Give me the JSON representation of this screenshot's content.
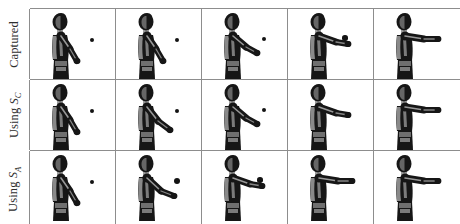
{
  "figure": {
    "type": "motion-capture-frame-grid",
    "rows": 3,
    "columns": 5,
    "background_color": "#ffffff",
    "line_color": "#8d8d8d",
    "figure_color": "#1a1a1a",
    "skin_color": "#9a9a9a",
    "ball_color": "#131313"
  },
  "rows": [
    {
      "id": "row-captured",
      "label": "Captured",
      "label_prefix": "Captured",
      "label_symbol": "",
      "label_subscript": "",
      "frames": [
        {
          "index": 1,
          "arm_stage": "down",
          "ball_x": 62,
          "ball_y": 31,
          "ball_r": 2.4,
          "ball_visible": true
        },
        {
          "index": 2,
          "arm_stage": "down",
          "ball_x": 61,
          "ball_y": 31,
          "ball_r": 2.4,
          "ball_visible": true
        },
        {
          "index": 3,
          "arm_stage": "mid",
          "ball_x": 62,
          "ball_y": 30,
          "ball_r": 2.4,
          "ball_visible": true
        },
        {
          "index": 4,
          "arm_stage": "reach",
          "ball_x": 57,
          "ball_y": 29,
          "ball_r": 2.8,
          "ball_visible": true
        },
        {
          "index": 5,
          "arm_stage": "extended",
          "ball_x": 0,
          "ball_y": 0,
          "ball_r": 0,
          "ball_visible": false
        }
      ]
    },
    {
      "id": "row-using-sc",
      "label": "Using SC",
      "label_prefix": "Using ",
      "label_symbol": "S",
      "label_subscript": "C",
      "frames": [
        {
          "index": 1,
          "arm_stage": "down",
          "ball_x": 62,
          "ball_y": 31,
          "ball_r": 2.4,
          "ball_visible": true
        },
        {
          "index": 2,
          "arm_stage": "lowmid",
          "ball_x": 61,
          "ball_y": 31,
          "ball_r": 2.4,
          "ball_visible": true
        },
        {
          "index": 3,
          "arm_stage": "mid",
          "ball_x": 62,
          "ball_y": 30,
          "ball_r": 2.4,
          "ball_visible": true
        },
        {
          "index": 4,
          "arm_stage": "reach",
          "ball_x": 0,
          "ball_y": 0,
          "ball_r": 0,
          "ball_visible": false
        },
        {
          "index": 5,
          "arm_stage": "extended",
          "ball_x": 0,
          "ball_y": 0,
          "ball_r": 0,
          "ball_visible": false
        }
      ]
    },
    {
      "id": "row-using-sa",
      "label": "Using SA",
      "label_prefix": "Using ",
      "label_symbol": "S",
      "label_subscript": "A",
      "frames": [
        {
          "index": 1,
          "arm_stage": "down",
          "ball_x": 62,
          "ball_y": 31,
          "ball_r": 2.4,
          "ball_visible": true
        },
        {
          "index": 2,
          "arm_stage": "reachlow",
          "ball_x": 61,
          "ball_y": 30,
          "ball_r": 3.0,
          "ball_visible": true
        },
        {
          "index": 3,
          "arm_stage": "reach",
          "ball_x": 58,
          "ball_y": 29,
          "ball_r": 2.8,
          "ball_visible": true
        },
        {
          "index": 4,
          "arm_stage": "extended",
          "ball_x": 0,
          "ball_y": 0,
          "ball_r": 0,
          "ball_visible": false
        },
        {
          "index": 5,
          "arm_stage": "extended",
          "ball_x": 0,
          "ball_y": 0,
          "ball_r": 0,
          "ball_visible": false
        }
      ]
    }
  ]
}
